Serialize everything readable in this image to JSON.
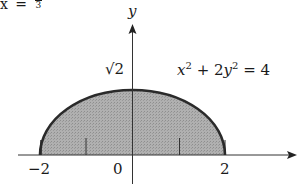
{
  "header": {
    "lhs": "x",
    "equals": "=",
    "frac_num": "8",
    "frac_den": "3"
  },
  "axes": {
    "y_label": "y",
    "x_ticks": [
      "−2",
      "0",
      "2"
    ],
    "y_tick": "√2"
  },
  "equation": {
    "x_var": "x",
    "x_exp": "2",
    "plus": "+ 2",
    "y_var": "y",
    "y_exp": "2",
    "rhs": "= 4"
  },
  "colors": {
    "fill": "#a9a9a9",
    "curve": "#2a2a2a",
    "axis": "#333333"
  }
}
